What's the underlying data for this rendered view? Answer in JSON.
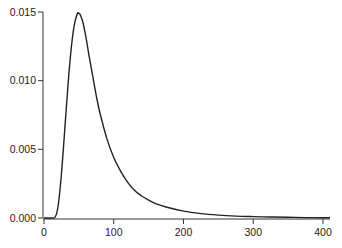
{
  "chart_data": {
    "type": "line",
    "title": "",
    "xlabel": "",
    "ylabel": "",
    "xlim": [
      0,
      410
    ],
    "ylim": [
      0,
      0.015
    ],
    "grid": false,
    "legend": null,
    "x_ticks": [
      0,
      100,
      200,
      300,
      400
    ],
    "x_tick_labels": [
      "0",
      "100",
      "200",
      "300",
      "400"
    ],
    "y_ticks": [
      0.0,
      0.005,
      0.01,
      0.015
    ],
    "y_tick_labels": [
      "0.000",
      "0.005",
      "0.010",
      "0.015"
    ],
    "series": [
      {
        "name": "density",
        "color": "#222222",
        "x": [
          0,
          10,
          15,
          18,
          20,
          22,
          25,
          28,
          30,
          33,
          36,
          40,
          44,
          48,
          50,
          52,
          56,
          60,
          65,
          70,
          75,
          80,
          90,
          100,
          110,
          120,
          130,
          140,
          150,
          160,
          175,
          200,
          225,
          250,
          275,
          300,
          325,
          350,
          375,
          400,
          410
        ],
        "y": [
          0,
          0,
          2e-05,
          0.0003,
          0.0008,
          0.0016,
          0.0032,
          0.0052,
          0.0066,
          0.0087,
          0.0107,
          0.0128,
          0.0142,
          0.0149,
          0.0149,
          0.0148,
          0.0142,
          0.0132,
          0.0117,
          0.0103,
          0.0089,
          0.0077,
          0.0058,
          0.0044,
          0.0034,
          0.0026,
          0.002,
          0.0016,
          0.0013,
          0.00105,
          0.0008,
          0.0005,
          0.00032,
          0.00021,
          0.00014,
          0.0001,
          7e-05,
          5e-05,
          3e-05,
          2e-05,
          2e-05
        ]
      }
    ]
  }
}
